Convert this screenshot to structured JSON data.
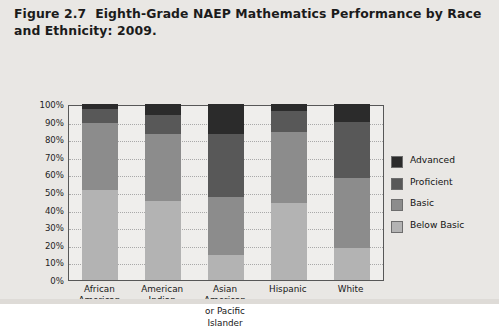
{
  "caption": {
    "figure_number": "Figure 2.7",
    "text": "Eighth-Grade NAEP Mathematics Performance by Race and Ethnicity: 2009."
  },
  "colors": {
    "advanced": "#2b2b2b",
    "proficient": "#585858",
    "basic": "#8c8c8c",
    "below_basic": "#b3b3b3",
    "plot_background": "#efeeec",
    "plot_border": "#575757",
    "page_background": "#e9e7e4",
    "gridline": "#a9a9a9"
  },
  "legend": {
    "position": "right",
    "items": [
      {
        "label": "Advanced",
        "color": "#2b2b2b"
      },
      {
        "label": "Proficient",
        "color": "#585858"
      },
      {
        "label": "Basic",
        "color": "#8c8c8c"
      },
      {
        "label": "Below Basic",
        "color": "#b3b3b3"
      }
    ]
  },
  "y_axis": {
    "ticks": [
      "100%",
      "90%",
      "80%",
      "70%",
      "60%",
      "50%",
      "40%",
      "30%",
      "20%",
      "10%",
      "0%"
    ],
    "min": 0,
    "max": 100
  },
  "x_axis": {
    "labels": [
      [
        "African",
        "American"
      ],
      [
        "American",
        "Indian"
      ],
      [
        "Asian",
        "American",
        "or Pacific",
        "Islander"
      ],
      [
        "Hispanic"
      ],
      [
        "White"
      ]
    ]
  },
  "chart_data": {
    "type": "bar",
    "subtype": "stacked-100-percent",
    "title": "Eighth-Grade NAEP Mathematics Performance by Race and Ethnicity: 2009.",
    "xlabel": "",
    "ylabel": "",
    "ylim": [
      0,
      100
    ],
    "ytick_step": 10,
    "grid": true,
    "legend_position": "right",
    "categories": [
      "African American",
      "American Indian",
      "Asian American or Pacific Islander",
      "Hispanic",
      "White"
    ],
    "series": [
      {
        "name": "Below Basic",
        "color": "#b3b3b3",
        "values": [
          51,
          45,
          14,
          44,
          18
        ]
      },
      {
        "name": "Basic",
        "color": "#8c8c8c",
        "values": [
          38,
          38,
          33,
          40,
          40
        ]
      },
      {
        "name": "Proficient",
        "color": "#585858",
        "values": [
          8,
          11,
          36,
          12,
          32
        ]
      },
      {
        "name": "Advanced",
        "color": "#2b2b2b",
        "values": [
          3,
          6,
          17,
          4,
          10
        ]
      }
    ],
    "stack_order_bottom_to_top": [
      "Below Basic",
      "Basic",
      "Proficient",
      "Advanced"
    ]
  }
}
